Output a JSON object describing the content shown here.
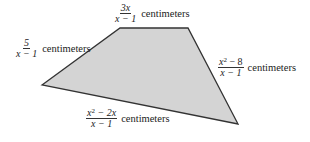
{
  "diagram": {
    "type": "quadrilateral",
    "fill_color": "#d4d4d4",
    "stroke_color": "#333333",
    "vertices": [
      [
        42,
        85
      ],
      [
        120,
        28
      ],
      [
        188,
        28
      ],
      [
        238,
        124
      ]
    ],
    "sides": [
      {
        "id": "left",
        "numerator": "5",
        "denominator": "x − 1",
        "unit": "centimeters"
      },
      {
        "id": "top",
        "numerator": "3x",
        "denominator": "x − 1",
        "unit": "centimeters"
      },
      {
        "id": "right",
        "numerator_base": "x",
        "numerator_exp": "2",
        "numerator_rest": " − 8",
        "denominator": "x − 1",
        "unit": "centimeters"
      },
      {
        "id": "bottom",
        "numerator_base": "x",
        "numerator_exp": "2",
        "numerator_rest": " − 2x",
        "denominator": "x − 1",
        "unit": "centimeters"
      }
    ]
  }
}
